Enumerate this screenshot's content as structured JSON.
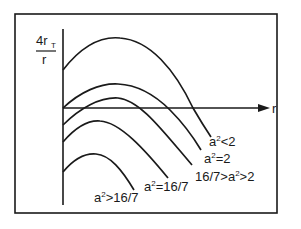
{
  "diagram": {
    "y_axis_label_top": "4r",
    "y_axis_label_sub": "T",
    "y_axis_label_bottom": "r",
    "x_axis_label": "r",
    "stroke_color": "#1a1a1a",
    "background": "#ffffff",
    "curves": [
      {
        "id": "a2-lt-2",
        "label_base": "a",
        "label_exp": "2",
        "label_rel": "<2"
      },
      {
        "id": "a2-eq-2",
        "label_base": "a",
        "label_exp": "2",
        "label_rel": "=2"
      },
      {
        "id": "a2-between",
        "label_pre": "16/7>",
        "label_base": "a",
        "label_exp": "2",
        "label_rel": ">2"
      },
      {
        "id": "a2-eq-16-7",
        "label_base": "a",
        "label_exp": "2",
        "label_rel": "=16/7"
      },
      {
        "id": "a2-gt-16-7",
        "label_base": "a",
        "label_exp": "2",
        "label_rel": ">16/7"
      }
    ]
  }
}
